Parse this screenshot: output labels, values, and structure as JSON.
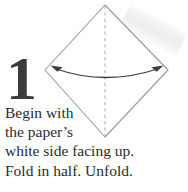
{
  "figure": {
    "step_number": "1",
    "caption_lines": [
      "Begin with",
      "the paper’s",
      "white side facing up.",
      "Fold in half. Unfold."
    ],
    "caption_full": "Begin with the paper’s white side facing up. Fold in half. Unfold.",
    "colors": {
      "background": "#ffffff",
      "paper_outline": "#9a9a9a",
      "fold_line": "#b4b4b4",
      "arrow": "#3d3d3d",
      "number": "#3b3b3b",
      "text": "#2b2b2b",
      "scan_artifact": "#ececec"
    },
    "paper": {
      "shape_name": "square-rotated-45-diamond",
      "vertices": {
        "top": [
          105,
          5
        ],
        "right": [
          168,
          70
        ],
        "bottom": [
          105,
          137
        ],
        "left": [
          45,
          70
        ]
      }
    },
    "fold_line": {
      "style": "dashed",
      "orientation": "vertical",
      "from": [
        105,
        6
      ],
      "to": [
        105,
        136
      ],
      "label": "valley-fold-center-line"
    },
    "arrow": {
      "style": "curved-double-headed",
      "direction": "left-right",
      "meaning": "fold in half and unfold",
      "start": [
        52,
        67
      ],
      "control": [
        105,
        86
      ],
      "end": [
        162,
        67
      ]
    }
  }
}
